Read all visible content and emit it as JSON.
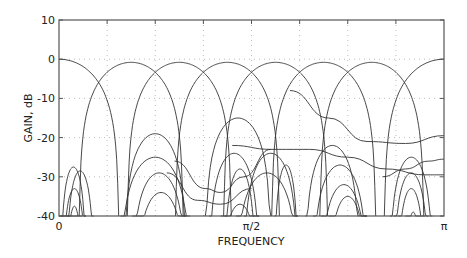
{
  "chart_data": {
    "type": "line",
    "title": "",
    "xlabel": "FREQUENCY",
    "ylabel": "GAIN, dB",
    "xlim": [
      0,
      3.14159
    ],
    "ylim": [
      -40,
      10
    ],
    "grid": true,
    "legend": null,
    "x_ticks": [
      {
        "value": 0,
        "label": "0"
      },
      {
        "value": 1.5708,
        "label": "π/2"
      },
      {
        "value": 3.14159,
        "label": "π"
      }
    ],
    "y_ticks": [
      {
        "value": 10,
        "label": "10"
      },
      {
        "value": 0,
        "label": "0"
      },
      {
        "value": -10,
        "label": "-10"
      },
      {
        "value": -20,
        "label": "-20"
      },
      {
        "value": -30,
        "label": "-30"
      },
      {
        "value": -40,
        "label": "-40"
      }
    ],
    "x_grid_fractions": [
      0.125,
      0.25,
      0.375,
      0.5,
      0.625,
      0.75,
      0.875
    ],
    "num_filters": 8,
    "series": [
      {
        "name": "filter 0",
        "center_fraction": 0.0,
        "peak_db": 0
      },
      {
        "name": "filter 1",
        "center_fraction": 0.1875,
        "peak_db": -1
      },
      {
        "name": "filter 2",
        "center_fraction": 0.3125,
        "peak_db": -1
      },
      {
        "name": "filter 3",
        "center_fraction": 0.4375,
        "peak_db": -1
      },
      {
        "name": "filter 4",
        "center_fraction": 0.5625,
        "peak_db": -1
      },
      {
        "name": "filter 5",
        "center_fraction": 0.6875,
        "peak_db": -1
      },
      {
        "name": "filter 6",
        "center_fraction": 0.8125,
        "peak_db": -1
      },
      {
        "name": "filter 7",
        "center_fraction": 1.0,
        "peak_db": 0
      }
    ],
    "sidelobes": [
      {
        "from": 0.0,
        "to": 0.05,
        "peak_db": -40
      },
      {
        "from": 0.005,
        "to": 0.07,
        "peak_db": -27.5
      },
      {
        "from": 0.02,
        "to": 0.09,
        "peak_db": -28.5
      },
      {
        "from": 0.01,
        "to": 0.07,
        "peak_db": -33
      },
      {
        "from": 0.02,
        "to": 0.06,
        "peak_db": -37.5
      },
      {
        "from": 0.16,
        "to": 0.34,
        "peak_db": -25
      },
      {
        "from": 0.17,
        "to": 0.33,
        "peak_db": -19
      },
      {
        "from": 0.19,
        "to": 0.33,
        "peak_db": -29
      },
      {
        "from": 0.2,
        "to": 0.33,
        "peak_db": -34
      },
      {
        "from": 0.38,
        "to": 0.55,
        "peak_db": -15
      },
      {
        "from": 0.39,
        "to": 0.52,
        "peak_db": -24
      },
      {
        "from": 0.42,
        "to": 0.52,
        "peak_db": -37
      },
      {
        "from": 0.43,
        "to": 0.51,
        "peak_db": -28
      },
      {
        "from": 0.48,
        "to": 0.62,
        "peak_db": -24
      },
      {
        "from": 0.56,
        "to": 0.62,
        "peak_db": -27
      },
      {
        "from": 0.46,
        "to": 0.62,
        "peak_db": -29
      },
      {
        "from": 0.64,
        "to": 0.78,
        "peak_db": -22
      },
      {
        "from": 0.66,
        "to": 0.8,
        "peak_db": -27
      },
      {
        "from": 0.68,
        "to": 0.8,
        "peak_db": -32
      },
      {
        "from": 0.7,
        "to": 0.8,
        "peak_db": -35
      },
      {
        "from": 0.86,
        "to": 0.97,
        "peak_db": -25
      },
      {
        "from": 0.87,
        "to": 0.96,
        "peak_db": -29
      },
      {
        "from": 0.88,
        "to": 0.95,
        "peak_db": -33
      },
      {
        "from": 0.9,
        "to": 0.94,
        "peak_db": -39
      }
    ],
    "wavy_tails": [
      {
        "points": [
          [
            0.6,
            -8
          ],
          [
            0.7,
            -15
          ],
          [
            0.8,
            -21
          ],
          [
            0.9,
            -21.5
          ],
          [
            1.0,
            -19.5
          ]
        ]
      },
      {
        "points": [
          [
            0.45,
            -22
          ],
          [
            0.55,
            -23
          ],
          [
            0.65,
            -23
          ],
          [
            0.75,
            -25
          ],
          [
            0.85,
            -28
          ],
          [
            0.95,
            -29.5
          ],
          [
            1.0,
            -29.5
          ]
        ]
      },
      {
        "points": [
          [
            0.3,
            -26
          ],
          [
            0.38,
            -33
          ],
          [
            0.42,
            -34
          ],
          [
            0.48,
            -30
          ],
          [
            0.55,
            -23
          ]
        ]
      },
      {
        "points": [
          [
            0.28,
            -29
          ],
          [
            0.36,
            -36
          ],
          [
            0.42,
            -37
          ],
          [
            0.5,
            -33
          ]
        ]
      },
      {
        "points": [
          [
            0.84,
            -30
          ],
          [
            0.9,
            -28
          ],
          [
            0.96,
            -26
          ],
          [
            1.0,
            -25.5
          ]
        ]
      }
    ]
  },
  "axes": {
    "xlabel": "FREQUENCY",
    "ylabel": "GAIN, dB"
  }
}
